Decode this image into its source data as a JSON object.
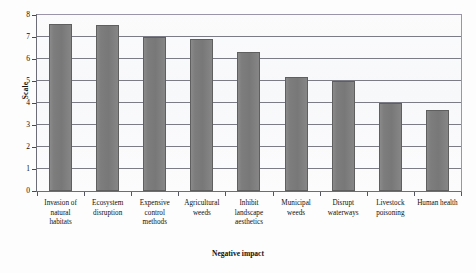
{
  "chart_data": {
    "type": "bar",
    "title": "",
    "xlabel": "Negative impact",
    "ylabel": "Scale",
    "ylim": [
      0,
      8
    ],
    "yticks": [
      0,
      1,
      2,
      3,
      4,
      5,
      6,
      7,
      8
    ],
    "grid": true,
    "legend": "none",
    "bar_color": "#7d7d7d",
    "categories": [
      "Invasion of natural habitats",
      "Ecosystem disruption",
      "Expensive control methods",
      "Agricultural weeds",
      "Inhibit landscape aesthetics",
      "Municipal weeds",
      "Disrupt waterways",
      "Livestock poisoning",
      "Human health"
    ],
    "category_lines": [
      [
        "Invasion of",
        "natural",
        "habitats"
      ],
      [
        "Ecosystem",
        "disruption"
      ],
      [
        "Expensive",
        "control",
        "methods"
      ],
      [
        "Agricultural",
        "weeds"
      ],
      [
        "Inhibit",
        "landscape",
        "aesthetics"
      ],
      [
        "Municipal",
        "weeds"
      ],
      [
        "Disrupt",
        "waterways"
      ],
      [
        "Livestock",
        "poisoning"
      ],
      [
        "Human health"
      ]
    ],
    "values": [
      7.6,
      7.55,
      7.0,
      6.9,
      6.3,
      5.2,
      5.0,
      4.0,
      3.7
    ]
  }
}
